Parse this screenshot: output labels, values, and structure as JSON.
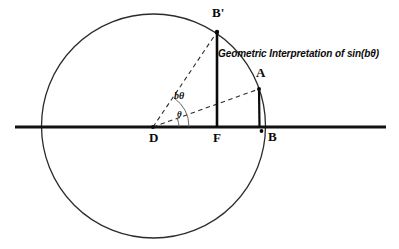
{
  "figure": {
    "title": "Geometric Interpretation of sin(bθ)",
    "title_x": 218,
    "title_y": 54,
    "background_color": "#ffffff",
    "stroke_color": "#1a1a1a",
    "canvas": {
      "width": 399,
      "height": 249
    }
  },
  "axis": {
    "name": "horizontal-axis",
    "x1": 15,
    "y1": 127,
    "x2": 386,
    "y2": 127,
    "stroke_width": 2.6
  },
  "circle": {
    "name": "unit-circle",
    "cx": 153.5,
    "cy": 126,
    "r": 112,
    "stroke_width": 1.3
  },
  "points": [
    {
      "id": "D",
      "label": "D",
      "x": 153,
      "y": 127,
      "label_x": 151,
      "label_y": 131,
      "role": "circle-center-origin"
    },
    {
      "id": "F",
      "label": "F",
      "x": 217,
      "y": 127,
      "label_x": 214,
      "label_y": 131,
      "role": "foot-of-perpendicular"
    },
    {
      "id": "B",
      "label": "B",
      "x": 261,
      "y": 127,
      "label_x": 268,
      "label_y": 131,
      "role": "circle-right-intersection"
    },
    {
      "id": "Bprime",
      "label": "B'",
      "x": 217,
      "y": 32,
      "label_x": 212,
      "label_y": 8,
      "role": "arc-endpoint-upper"
    },
    {
      "id": "A",
      "label": "A",
      "x": 259,
      "y": 89,
      "label_x": 258,
      "label_y": 68,
      "role": "arc-point"
    }
  ],
  "segments": [
    {
      "name": "segment-bprime-f",
      "x1": 217,
      "y1": 32,
      "x2": 217,
      "y2": 127,
      "style": "solid",
      "stroke_width": 2.6,
      "meaning": "sin(bθ) height"
    },
    {
      "name": "segment-a-b",
      "x1": 259,
      "y1": 89,
      "x2": 259.5,
      "y2": 127,
      "style": "solid",
      "stroke_width": 2.2,
      "meaning": "sin(θ) height"
    },
    {
      "name": "segment-d-bprime-dashed",
      "x1": 153,
      "y1": 127,
      "x2": 217,
      "y2": 32,
      "style": "dashed",
      "stroke_width": 1.1,
      "meaning": "radius to B prime"
    },
    {
      "name": "segment-d-a-dashed",
      "x1": 153,
      "y1": 127,
      "x2": 259,
      "y2": 89,
      "style": "dashed",
      "stroke_width": 1.1,
      "meaning": "radius to A"
    }
  ],
  "angle_arcs": [
    {
      "name": "angle-arc-btheta",
      "label": "bθ",
      "label_x": 176,
      "label_y": 96,
      "cx": 153,
      "cy": 127,
      "r": 36
    },
    {
      "name": "angle-arc-theta",
      "label": "θ",
      "label_x": 176,
      "label_y": 115,
      "cx": 153,
      "cy": 127,
      "r": 26
    }
  ],
  "chart_data": {
    "type": "diagram",
    "title": "Geometric Interpretation of sin(bθ)",
    "labels": [
      "D",
      "F",
      "B",
      "B'",
      "A",
      "bθ",
      "θ"
    ]
  }
}
